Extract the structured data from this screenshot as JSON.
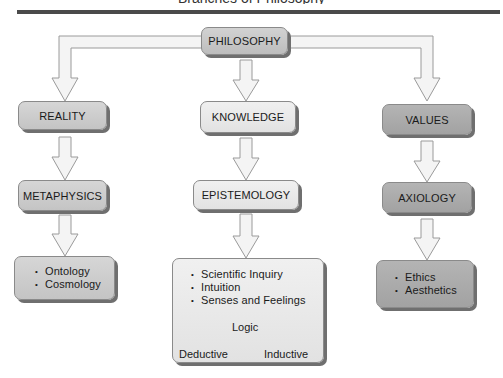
{
  "header": {
    "title_partial": "Branches of Philosophy"
  },
  "diagram": {
    "root": {
      "label": "PHILOSOPHY",
      "color": "#c8c8c8"
    },
    "columns": [
      {
        "id": "reality",
        "level1": "REALITY",
        "level2": "METAPHYSICS",
        "items": [
          "Ontology",
          "Cosmology"
        ],
        "color": "#cccccc"
      },
      {
        "id": "knowledge",
        "level1": "KNOWLEDGE",
        "level2": "EPISTEMOLOGY",
        "items": [
          "Scientific Inquiry",
          "Intuition",
          "Senses and Feelings"
        ],
        "logic": {
          "label": "Logic",
          "branches": [
            "Deductive",
            "Inductive"
          ]
        },
        "color": "#e8e8e8"
      },
      {
        "id": "values",
        "level1": "VALUES",
        "level2": "AXIOLOGY",
        "items": [
          "Ethics",
          "Aesthetics"
        ],
        "color": "#aaaaaa"
      }
    ]
  }
}
